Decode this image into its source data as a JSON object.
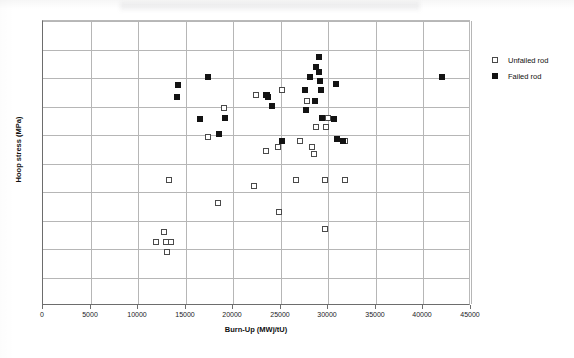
{
  "chart_data": {
    "type": "scatter",
    "title": "",
    "xlabel": "Burn-Up (MWj/tU)",
    "ylabel": "Hoop stress (MPa)",
    "xlim": [
      0,
      45000
    ],
    "ylim": [
      0,
      100
    ],
    "xticks": [
      0,
      5000,
      10000,
      15000,
      20000,
      25000,
      30000,
      35000,
      40000,
      45000
    ],
    "xtick_labels": [
      "0",
      "5000",
      "10000",
      "15000",
      "20000",
      "25000",
      "30000",
      "35000",
      "40000",
      "45000"
    ],
    "yticks": [
      0,
      10,
      20,
      30,
      40,
      50,
      60,
      70,
      80,
      90,
      100
    ],
    "ytick_labels": [
      "",
      "",
      "",
      "",
      "",
      "",
      "",
      "",
      "",
      "",
      ""
    ],
    "grid": true,
    "legend_position": "right",
    "series": [
      {
        "name": "Unfailed rod",
        "marker": "open-square",
        "color": "#ffffff",
        "edge_color": "#4a4a4a",
        "points": [
          {
            "x": 11900,
            "y": 22.5
          },
          {
            "x": 12750,
            "y": 26.0
          },
          {
            "x": 12900,
            "y": 22.5
          },
          {
            "x": 13450,
            "y": 22.5
          },
          {
            "x": 13050,
            "y": 18.8
          },
          {
            "x": 13200,
            "y": 44.2
          },
          {
            "x": 17300,
            "y": 59.3
          },
          {
            "x": 18450,
            "y": 36.1
          },
          {
            "x": 19050,
            "y": 69.5
          },
          {
            "x": 22200,
            "y": 42.1
          },
          {
            "x": 22400,
            "y": 74.0
          },
          {
            "x": 23400,
            "y": 54.4
          },
          {
            "x": 24700,
            "y": 55.8
          },
          {
            "x": 24850,
            "y": 33.0
          },
          {
            "x": 25150,
            "y": 75.8
          },
          {
            "x": 26600,
            "y": 44.2
          },
          {
            "x": 27000,
            "y": 57.9
          },
          {
            "x": 27800,
            "y": 71.9
          },
          {
            "x": 28250,
            "y": 55.8
          },
          {
            "x": 28500,
            "y": 53.3
          },
          {
            "x": 28750,
            "y": 62.8
          },
          {
            "x": 29600,
            "y": 27.0
          },
          {
            "x": 29700,
            "y": 44.2
          },
          {
            "x": 29800,
            "y": 62.8
          },
          {
            "x": 30000,
            "y": 66.0
          },
          {
            "x": 31800,
            "y": 57.9
          },
          {
            "x": 31700,
            "y": 44.2
          }
        ]
      },
      {
        "name": "Failed rod",
        "marker": "filled-square",
        "color": "#131313",
        "edge_color": "#131313",
        "points": [
          {
            "x": 14200,
            "y": 77.5
          },
          {
            "x": 14050,
            "y": 73.3
          },
          {
            "x": 16500,
            "y": 65.6
          },
          {
            "x": 17400,
            "y": 80.4
          },
          {
            "x": 18500,
            "y": 60.5
          },
          {
            "x": 19150,
            "y": 66.0
          },
          {
            "x": 23400,
            "y": 74.0
          },
          {
            "x": 23600,
            "y": 74.0
          },
          {
            "x": 23700,
            "y": 73.3
          },
          {
            "x": 24100,
            "y": 70.2
          },
          {
            "x": 25100,
            "y": 57.9
          },
          {
            "x": 27500,
            "y": 75.8
          },
          {
            "x": 27700,
            "y": 68.8
          },
          {
            "x": 28100,
            "y": 80.4
          },
          {
            "x": 28600,
            "y": 71.9
          },
          {
            "x": 28750,
            "y": 83.9
          },
          {
            "x": 29000,
            "y": 87.4
          },
          {
            "x": 29050,
            "y": 82.1
          },
          {
            "x": 29100,
            "y": 79.0
          },
          {
            "x": 29200,
            "y": 75.8
          },
          {
            "x": 29300,
            "y": 66.0
          },
          {
            "x": 30600,
            "y": 65.6
          },
          {
            "x": 30800,
            "y": 78.0
          },
          {
            "x": 30900,
            "y": 58.6
          },
          {
            "x": 31500,
            "y": 57.9
          },
          {
            "x": 41900,
            "y": 80.4
          }
        ]
      }
    ]
  },
  "legend": {
    "items": [
      {
        "label": "Unfailed rod",
        "style": "unfailed"
      },
      {
        "label": "Failed rod",
        "style": "failed"
      }
    ]
  },
  "axes": {
    "x_title": "Burn-Up (MWj/tU)",
    "y_title": "Hoop stress (MPa)"
  }
}
